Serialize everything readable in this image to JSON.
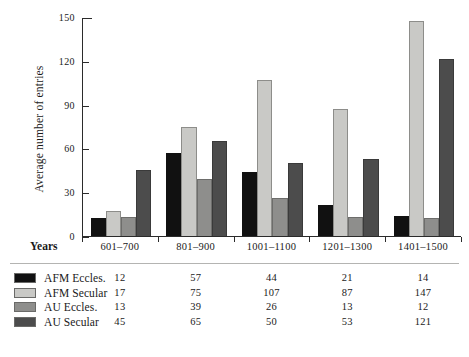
{
  "chart_data": {
    "type": "bar",
    "title": "",
    "subtitle": "",
    "xlabel": "Years",
    "ylabel": "Average number of entries",
    "categories": [
      "601–700",
      "801–900",
      "1001–1100",
      "1201–1300",
      "1401–1500"
    ],
    "series": [
      {
        "name": "AFM Eccles.",
        "color": "#111111",
        "values": [
          12,
          57,
          44,
          21,
          14
        ]
      },
      {
        "name": "AFM Secular",
        "color": "#c9c9c6",
        "values": [
          17,
          75,
          107,
          87,
          147
        ]
      },
      {
        "name": "AU Eccles.",
        "color": "#8e8e8c",
        "values": [
          13,
          39,
          26,
          13,
          12
        ]
      },
      {
        "name": "AU Secular",
        "color": "#4c4c4c",
        "values": [
          45,
          65,
          50,
          53,
          121
        ]
      }
    ],
    "ylim": [
      0,
      150
    ],
    "yticks": [
      0,
      30,
      60,
      90,
      120,
      150
    ],
    "ytick_labels": [
      "0",
      "30",
      "60",
      "90",
      "120",
      "150"
    ],
    "grid": false,
    "legend_position": "bottom-table"
  },
  "axis": {
    "y_title": "Average number of entries",
    "x_title": "Years",
    "y_ticks": [
      "150",
      "120",
      "90",
      "60",
      "30",
      "0"
    ]
  },
  "legend": {
    "rows": [
      {
        "name": "AFM Eccles.",
        "values": [
          "12",
          "57",
          "44",
          "21",
          "14"
        ]
      },
      {
        "name": "AFM Secular",
        "values": [
          "17",
          "75",
          "107",
          "87",
          "147"
        ]
      },
      {
        "name": "AU Eccles.",
        "values": [
          "13",
          "39",
          "26",
          "13",
          "12"
        ]
      },
      {
        "name": "AU Secular",
        "values": [
          "45",
          "65",
          "50",
          "53",
          "121"
        ]
      }
    ]
  }
}
